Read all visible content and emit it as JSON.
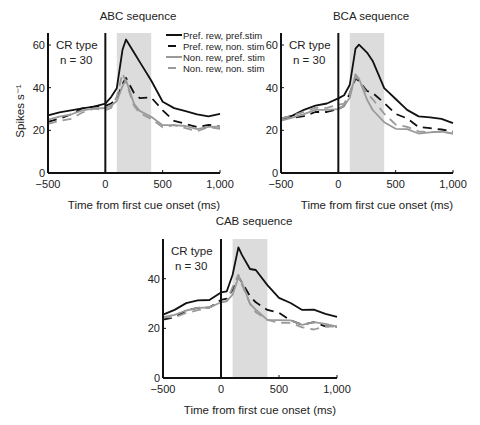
{
  "chart_data": [
    {
      "type": "line",
      "title": "ABC sequence",
      "xlabel": "Time from first cue onset (ms)",
      "ylabel": "Spikes s⁻¹",
      "annotation": [
        "CR type",
        "n = 30"
      ],
      "xlim": [
        -500,
        1000
      ],
      "ylim": [
        0,
        65
      ],
      "xticks": [
        "−500",
        "0",
        "500",
        "1,000"
      ],
      "xtick_values": [
        -500,
        0,
        500,
        1000
      ],
      "yticks": [
        "0",
        "20",
        "40",
        "60"
      ],
      "ytick_values": [
        0,
        20,
        40,
        60
      ],
      "shaded_region": [
        100,
        400
      ],
      "vline": 0,
      "x": [
        -500,
        -400,
        -300,
        -200,
        -100,
        0,
        50,
        100,
        150,
        180,
        250,
        300,
        400,
        500,
        600,
        700,
        800,
        900,
        1000
      ],
      "series": [
        {
          "name": "Pref. rew, pref.stim",
          "style": "solid-black",
          "values": [
            27,
            28,
            30,
            30,
            31,
            33,
            35,
            40,
            58,
            62,
            57,
            52,
            43,
            34,
            30,
            29,
            28,
            26,
            28
          ]
        },
        {
          "name": "Pref. rew, non. stim",
          "style": "dashed-black",
          "values": [
            24,
            25,
            28,
            30,
            31,
            32,
            32,
            35,
            42,
            44,
            38,
            35,
            35,
            30,
            24,
            23,
            22,
            22,
            22
          ]
        },
        {
          "name": "Non. rew, pref. stim",
          "style": "solid-gray",
          "values": [
            25,
            26,
            28,
            29,
            30,
            31,
            31,
            34,
            41,
            43,
            33,
            29,
            26,
            23,
            22,
            22,
            21,
            21,
            22
          ]
        },
        {
          "name": "Non. rew, non. stim",
          "style": "dashed-gray",
          "values": [
            23,
            24,
            26,
            28,
            30,
            30,
            30,
            36,
            47,
            42,
            32,
            28,
            25,
            22,
            22,
            21,
            20,
            21,
            21
          ]
        }
      ]
    },
    {
      "type": "line",
      "title": "BCA sequence",
      "xlabel": "Time from first cue onset (ms)",
      "ylabel": "",
      "annotation": [
        "CR type",
        "n = 30"
      ],
      "xlim": [
        -500,
        1000
      ],
      "ylim": [
        0,
        65
      ],
      "xticks": [
        "−500",
        "0",
        "500",
        "1,000"
      ],
      "xtick_values": [
        -500,
        0,
        500,
        1000
      ],
      "yticks": [
        "0",
        "20",
        "40",
        "60"
      ],
      "ytick_values": [
        0,
        20,
        40,
        60
      ],
      "shaded_region": [
        100,
        400
      ],
      "vline": 0,
      "x": [
        -500,
        -400,
        -300,
        -200,
        -100,
        0,
        50,
        100,
        150,
        180,
        250,
        300,
        400,
        500,
        600,
        700,
        800,
        900,
        1000
      ],
      "series": [
        {
          "name": "Pref. rew, pref.stim",
          "style": "solid-black",
          "values": [
            25,
            27,
            30,
            31,
            33,
            35,
            36,
            42,
            58,
            60,
            57,
            52,
            40,
            35,
            29,
            27,
            26,
            25,
            24
          ]
        },
        {
          "name": "Pref. rew, non. stim",
          "style": "dashed-black",
          "values": [
            25,
            26,
            27,
            28,
            29,
            30,
            31,
            38,
            44,
            43,
            39,
            37,
            33,
            28,
            25,
            22,
            21,
            20,
            20
          ]
        },
        {
          "name": "Non. rew, pref. stim",
          "style": "solid-gray",
          "values": [
            24,
            26,
            28,
            29,
            30,
            30,
            31,
            36,
            46,
            44,
            35,
            29,
            24,
            21,
            20,
            19,
            19,
            19,
            19
          ]
        },
        {
          "name": "Non. rew, non. stim",
          "style": "dashed-gray",
          "values": [
            25,
            27,
            29,
            30,
            31,
            32,
            32,
            38,
            45,
            43,
            38,
            34,
            28,
            23,
            21,
            20,
            19,
            19,
            19
          ]
        }
      ]
    },
    {
      "type": "line",
      "title": "CAB sequence",
      "xlabel": "Time from first cue onset (ms)",
      "ylabel": "",
      "annotation": [
        "CR type",
        "n = 30"
      ],
      "xlim": [
        -500,
        1000
      ],
      "ylim": [
        0,
        56
      ],
      "xticks": [
        "−500",
        "0",
        "500",
        "1,000"
      ],
      "xtick_values": [
        -500,
        0,
        500,
        1000
      ],
      "yticks": [
        "0",
        "20",
        "40"
      ],
      "ytick_values": [
        0,
        20,
        40
      ],
      "shaded_region": [
        100,
        400
      ],
      "vline": 0,
      "x": [
        -500,
        -400,
        -300,
        -200,
        -100,
        0,
        50,
        100,
        150,
        180,
        250,
        300,
        400,
        500,
        600,
        700,
        800,
        900,
        1000
      ],
      "series": [
        {
          "name": "Pref. rew, pref.stim",
          "style": "solid-black",
          "values": [
            25,
            28,
            30,
            31,
            32,
            34,
            35,
            42,
            52,
            50,
            44,
            43,
            38,
            32,
            30,
            28,
            27,
            26,
            25
          ]
        },
        {
          "name": "Pref. rew, non. stim",
          "style": "dashed-black",
          "values": [
            23,
            25,
            27,
            28,
            29,
            31,
            32,
            36,
            40,
            39,
            33,
            30,
            28,
            26,
            23,
            22,
            22,
            21,
            21
          ]
        },
        {
          "name": "Non. rew, pref. stim",
          "style": "solid-gray",
          "values": [
            24,
            26,
            27,
            28,
            29,
            30,
            31,
            34,
            40,
            39,
            30,
            27,
            24,
            23,
            23,
            22,
            22,
            22,
            21
          ]
        },
        {
          "name": "Non. rew, non. stim",
          "style": "dashed-gray",
          "values": [
            24,
            25,
            26,
            27,
            29,
            30,
            31,
            37,
            41,
            38,
            30,
            26,
            24,
            22,
            22,
            21,
            19,
            21,
            21
          ]
        }
      ]
    }
  ],
  "legend": {
    "items": [
      "Pref. rew, pref.stim",
      "Pref. rew, non. stim",
      "Non. rew, pref. stim",
      "Non. rew, non. stim"
    ]
  },
  "colors": {
    "black_line": "#111111",
    "gray_line": "#9a9a9a",
    "shade": "#dcdcdc"
  }
}
